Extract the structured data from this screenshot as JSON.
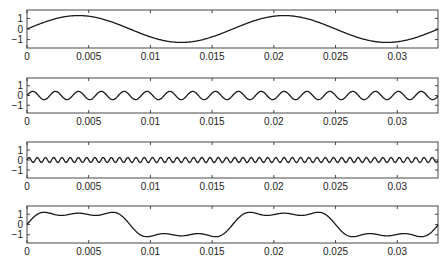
{
  "chart_data": [
    {
      "type": "line",
      "title": "",
      "xlabel": "",
      "ylabel": "",
      "description": "Fundamental (1st harmonic) sine component",
      "function": {
        "amplitude": 1.2732,
        "frequency_hz": 60,
        "harmonic": 1
      },
      "xlim": [
        0,
        0.0333
      ],
      "ylim": [
        -1.8,
        1.8
      ],
      "xticks": [
        0,
        0.005,
        0.01,
        0.015,
        0.02,
        0.025,
        0.03
      ],
      "xtick_labels": [
        "0",
        "0.005",
        "0.01",
        "0.015",
        "0.02",
        "0.025",
        "0.03"
      ],
      "yticks": [
        1,
        0,
        -1
      ],
      "ytick_labels": [
        "1",
        "0",
        "−1"
      ],
      "grid": false,
      "x": [
        0,
        0.00208,
        0.00417,
        0.00625,
        0.00833,
        0.01042,
        0.0125,
        0.01458,
        0.01667,
        0.01875,
        0.02083,
        0.02292,
        0.025,
        0.02708,
        0.02917,
        0.03125,
        0.0333
      ],
      "y": [
        0,
        0.9,
        1.27,
        0.9,
        0,
        -0.9,
        -1.27,
        -0.9,
        0,
        0.9,
        1.27,
        0.9,
        0,
        -0.9,
        -1.27,
        -0.9,
        0
      ]
    },
    {
      "type": "line",
      "title": "",
      "description": "3rd harmonic sine component",
      "function": {
        "amplitude": 0.4244,
        "frequency_hz": 180,
        "harmonic": 3
      },
      "xlim": [
        0,
        0.0333
      ],
      "ylim": [
        -1.8,
        1.8
      ],
      "xticks": [
        0,
        0.005,
        0.01,
        0.015,
        0.02,
        0.025,
        0.03
      ],
      "xtick_labels": [
        "0",
        "0.005",
        "0.01",
        "0.015",
        "0.02",
        "0.025",
        "0.03"
      ],
      "yticks": [
        1,
        0,
        -1
      ],
      "ytick_labels": [
        "1",
        "0",
        "−1"
      ],
      "grid": false,
      "x": [
        0,
        0.00139,
        0.00278,
        0.00417,
        0.00556,
        0.00694,
        0.00833,
        0.00972,
        0.01111,
        0.0125,
        0.01389,
        0.01528,
        0.01667
      ],
      "y": [
        0,
        0.42,
        0,
        -0.42,
        0,
        0.42,
        0,
        -0.42,
        0,
        0.42,
        0,
        -0.42,
        0
      ]
    },
    {
      "type": "line",
      "title": "",
      "description": "5th harmonic sine component",
      "function": {
        "amplitude": 0.2546,
        "frequency_hz": 300,
        "harmonic": 5
      },
      "xlim": [
        0,
        0.0333
      ],
      "ylim": [
        -1.8,
        1.8
      ],
      "xticks": [
        0,
        0.005,
        0.01,
        0.015,
        0.02,
        0.025,
        0.03
      ],
      "xtick_labels": [
        "0",
        "0.005",
        "0.01",
        "0.015",
        "0.02",
        "0.025",
        "0.03"
      ],
      "yticks": [
        1,
        0,
        -1
      ],
      "ytick_labels": [
        "1",
        "0",
        "−1"
      ],
      "grid": false,
      "x": [
        0,
        0.00083,
        0.00167,
        0.0025,
        0.00333
      ],
      "y": [
        0,
        0.25,
        0,
        -0.25,
        0
      ]
    },
    {
      "type": "line",
      "title": "",
      "description": "Sum of 1st, 3rd and 5th harmonics (square-wave approximation)",
      "function": {
        "components": [
          1,
          3,
          5
        ],
        "frequency_hz": 60
      },
      "xlim": [
        0,
        0.0333
      ],
      "ylim": [
        -1.8,
        1.8
      ],
      "xticks": [
        0,
        0.005,
        0.01,
        0.015,
        0.02,
        0.025,
        0.03
      ],
      "xtick_labels": [
        "0",
        "0.005",
        "0.01",
        "0.015",
        "0.02",
        "0.025",
        "0.03"
      ],
      "yticks": [
        1,
        0,
        -1
      ],
      "ytick_labels": [
        "1",
        "0",
        "−1"
      ],
      "grid": false,
      "x": [
        0,
        0.0013,
        0.0025,
        0.0042,
        0.0058,
        0.0071,
        0.0083,
        0.0096,
        0.0113,
        0.0125,
        0.0138,
        0.0154,
        0.0167
      ],
      "y": [
        0,
        1.14,
        0.96,
        1.08,
        0.96,
        1.14,
        0,
        -1.14,
        -0.96,
        -1.08,
        -0.96,
        -1.14,
        0
      ]
    }
  ],
  "panels": [
    {
      "id": "fundamental",
      "top": 10,
      "bottom": 48
    },
    {
      "id": "third-harmonic",
      "top": 78,
      "bottom": 113
    },
    {
      "id": "fifth-harmonic",
      "top": 142,
      "bottom": 178
    },
    {
      "id": "sum",
      "top": 206,
      "bottom": 243
    }
  ],
  "axes_px": {
    "left": 27,
    "right": 438
  }
}
